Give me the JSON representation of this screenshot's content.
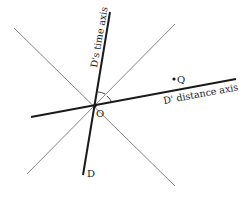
{
  "diagram": {
    "type": "spacetime-diagram",
    "labels": {
      "time_axis": "D's time axis",
      "distance_axis": "D' distance axis",
      "origin": "O",
      "observer": "D",
      "event": "Q"
    },
    "colors": {
      "axis": "#1a1a1a",
      "light_lines": "#777777",
      "background": "#ffffff"
    }
  }
}
